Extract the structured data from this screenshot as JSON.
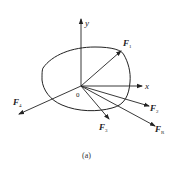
{
  "figure": {
    "caption": "(a)",
    "origin_label": "0",
    "axes": {
      "x_label": "x",
      "y_label": "y"
    },
    "forces": [
      {
        "name": "F",
        "sub": "1"
      },
      {
        "name": "F",
        "sub": "2"
      },
      {
        "name": "F",
        "sub": "3"
      },
      {
        "name": "F",
        "sub": "4"
      },
      {
        "name": "F",
        "sub": "R"
      }
    ],
    "colors": {
      "stroke": "#222222",
      "background": "#ffffff"
    }
  }
}
